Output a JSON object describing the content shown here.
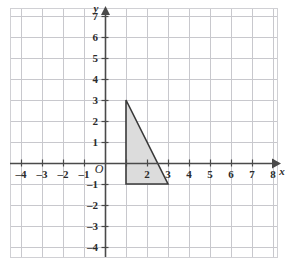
{
  "figure": {
    "background_color": "#ffffff"
  },
  "chart_data": {
    "type": "scatter",
    "title": "",
    "xlabel": "x",
    "ylabel": "y",
    "grid": true,
    "legend": null,
    "xlim": [
      -5,
      9
    ],
    "ylim": [
      -5,
      8
    ],
    "x_tick_values": [
      -4,
      -3,
      -2,
      -1,
      5,
      6,
      7,
      8
    ],
    "x_tick_labels": [
      "–4",
      "–3",
      "–2",
      "–1",
      "5",
      "6",
      "7",
      "8"
    ],
    "x_tick_values_overlapped": [
      2,
      3,
      4
    ],
    "x_tick_labels_overlapped": [
      "2",
      "3",
      "4"
    ],
    "y_tick_values": [
      7,
      6,
      5,
      4,
      3,
      2,
      1,
      -1,
      -2,
      -3,
      -4
    ],
    "y_tick_labels": [
      "7",
      "6",
      "5",
      "4",
      "3",
      "2",
      "1",
      "–1",
      "–2",
      "–3",
      "–4"
    ],
    "origin_label": "O",
    "shapes": [
      {
        "name": "shaded-triangle",
        "kind": "polygon",
        "vertices": [
          [
            1,
            3
          ],
          [
            1,
            -1
          ],
          [
            3,
            -1
          ]
        ],
        "fill": "#dcdcdc",
        "stroke": "#3a3a3a",
        "stroke_width": 1.6,
        "description": "right triangle, right angle at (1,-1)"
      }
    ],
    "colors": {
      "grid": "#c8c8cd",
      "axis": "#4a4a4a",
      "border": "#d0d0d4",
      "shape_fill": "#dcdcdc",
      "shape_stroke": "#3a3a3a",
      "text": "#2b2b2b"
    }
  }
}
